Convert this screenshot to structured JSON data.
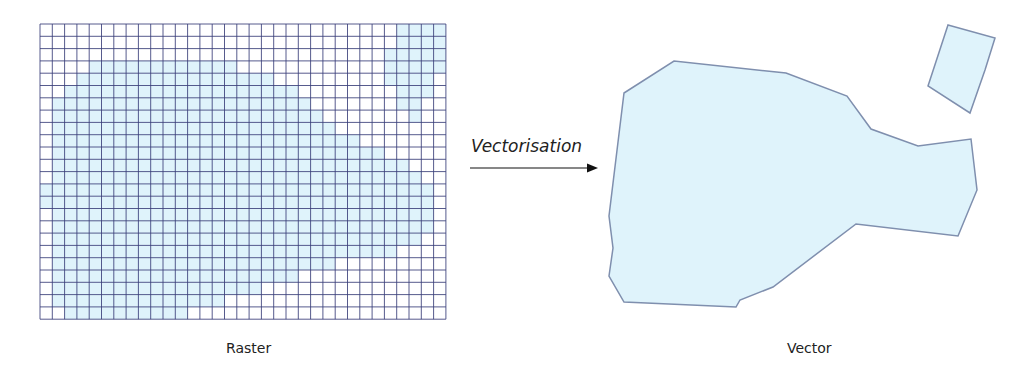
{
  "labels": {
    "raster": "Raster",
    "vector": "Vector",
    "process": "Vectorisation"
  },
  "colors": {
    "fill": "#dff3fb",
    "grid_line": "#3a3f7a",
    "polygon_stroke": "#7f8fae",
    "arrow": "#111111"
  },
  "raster": {
    "origin": [
      40,
      24
    ],
    "cell": 12.3,
    "cols": 33,
    "rows": 24,
    "filled_ranges": [
      [
        [
          29,
          32
        ]
      ],
      [
        [
          29,
          32
        ]
      ],
      [
        [
          28,
          32
        ]
      ],
      [
        [
          4,
          15
        ],
        [
          28,
          32
        ]
      ],
      [
        [
          3,
          18
        ],
        [
          28,
          31
        ]
      ],
      [
        [
          2,
          20
        ],
        [
          29,
          31
        ]
      ],
      [
        [
          1,
          21
        ],
        [
          29,
          30
        ]
      ],
      [
        [
          1,
          22
        ],
        [
          30,
          30
        ]
      ],
      [
        [
          1,
          23
        ]
      ],
      [
        [
          1,
          25
        ]
      ],
      [
        [
          1,
          27
        ]
      ],
      [
        [
          1,
          29
        ]
      ],
      [
        [
          1,
          30
        ]
      ],
      [
        [
          0,
          31
        ]
      ],
      [
        [
          0,
          31
        ]
      ],
      [
        [
          1,
          31
        ]
      ],
      [
        [
          1,
          31
        ]
      ],
      [
        [
          1,
          30
        ]
      ],
      [
        [
          1,
          28
        ]
      ],
      [
        [
          1,
          23
        ]
      ],
      [
        [
          1,
          20
        ]
      ],
      [
        [
          1,
          17
        ]
      ],
      [
        [
          1,
          14
        ]
      ],
      [
        [
          2,
          11
        ]
      ]
    ]
  },
  "vector": {
    "polygons": [
      [
        [
          624,
          93
        ],
        [
          674,
          61
        ],
        [
          786,
          73
        ],
        [
          847,
          96
        ],
        [
          871,
          129
        ],
        [
          918,
          146
        ],
        [
          971,
          139
        ],
        [
          977,
          190
        ],
        [
          958,
          236
        ],
        [
          856,
          224
        ],
        [
          773,
          287
        ],
        [
          740,
          300
        ],
        [
          736,
          307
        ],
        [
          624,
          302
        ],
        [
          609,
          276
        ],
        [
          613,
          248
        ],
        [
          609,
          216
        ]
      ],
      [
        [
          948,
          25
        ],
        [
          995,
          38
        ],
        [
          985,
          70
        ],
        [
          970,
          113
        ],
        [
          928,
          86
        ]
      ]
    ]
  },
  "arrow": {
    "x1": 0,
    "x2": 120,
    "y": 8
  }
}
